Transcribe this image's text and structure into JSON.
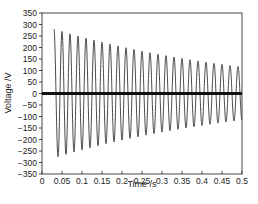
{
  "chart_data": {
    "type": "line",
    "title": "",
    "xlabel": "Time /s",
    "ylabel": "Voltage /V",
    "xlim": [
      0,
      0.5
    ],
    "ylim": [
      -350,
      350
    ],
    "x_ticks": [
      0,
      0.05,
      0.1,
      0.15,
      0.2,
      0.25,
      0.3,
      0.35,
      0.4,
      0.45,
      0.5
    ],
    "x_tick_labels": [
      "0",
      "0.05",
      "0.1",
      "0.15",
      "0.2",
      "0.25",
      "0.3",
      "0.35",
      "0.4",
      "0.45",
      "0.5"
    ],
    "y_ticks": [
      350,
      300,
      250,
      200,
      150,
      100,
      50,
      0,
      -50,
      -100,
      -150,
      -200,
      -250,
      -300,
      -350
    ],
    "y_tick_labels": [
      "350",
      "300",
      "250",
      "200",
      "150",
      "100",
      "50",
      "0",
      "-50",
      "-100",
      "-150",
      "-200",
      "-250",
      "-300",
      "-350"
    ],
    "grid": false,
    "legend": null,
    "series": [
      {
        "name": "Decaying AC voltage",
        "style": "thin line",
        "color": "#333333",
        "description": "50 Hz sinusoid starting at t≈0.03 s, amplitude decaying from ~280 V to ~115 V at t=0.5 s",
        "frequency_hz": 50,
        "start_time": 0.03,
        "peaks": [
          {
            "t": 0.03,
            "v": 280
          },
          {
            "t": 0.05,
            "v": 270
          },
          {
            "t": 0.07,
            "v": 262
          },
          {
            "t": 0.09,
            "v": 253
          },
          {
            "t": 0.11,
            "v": 245
          },
          {
            "t": 0.13,
            "v": 237
          },
          {
            "t": 0.15,
            "v": 229
          },
          {
            "t": 0.17,
            "v": 221
          },
          {
            "t": 0.19,
            "v": 213
          },
          {
            "t": 0.21,
            "v": 206
          },
          {
            "t": 0.23,
            "v": 199
          },
          {
            "t": 0.25,
            "v": 192
          },
          {
            "t": 0.27,
            "v": 185
          },
          {
            "t": 0.29,
            "v": 178
          },
          {
            "t": 0.31,
            "v": 172
          },
          {
            "t": 0.33,
            "v": 165
          },
          {
            "t": 0.35,
            "v": 159
          },
          {
            "t": 0.37,
            "v": 153
          },
          {
            "t": 0.39,
            "v": 147
          },
          {
            "t": 0.41,
            "v": 142
          },
          {
            "t": 0.43,
            "v": 136
          },
          {
            "t": 0.45,
            "v": 131
          },
          {
            "t": 0.47,
            "v": 126
          },
          {
            "t": 0.49,
            "v": 121
          }
        ],
        "amplitude_start": 280,
        "amplitude_end": 115
      },
      {
        "name": "DC level (thick)",
        "style": "thick line",
        "color": "#111111",
        "x": [
          0,
          0.5
        ],
        "y": [
          0,
          0
        ]
      }
    ]
  }
}
